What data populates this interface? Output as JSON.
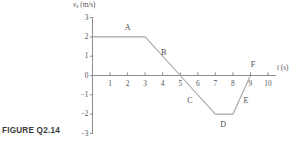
{
  "caption": "FIGURE Q2.14",
  "axes": {
    "y_title_main": "v",
    "y_title_sub": "x",
    "y_title_unit": " (m/s)",
    "x_title_main": "t",
    "x_title_unit": " (s)"
  },
  "chart_data": {
    "type": "line",
    "title": "",
    "xlabel": "t (s)",
    "ylabel": "v_x (m/s)",
    "xlim": [
      0,
      10.6
    ],
    "ylim": [
      -3,
      3
    ],
    "grid": false,
    "legend": "none",
    "xticks": [
      "1",
      "2",
      "3",
      "4",
      "5",
      "6",
      "7",
      "8",
      "9",
      "10"
    ],
    "xtick_values": [
      1,
      2,
      3,
      4,
      5,
      6,
      7,
      8,
      9,
      10
    ],
    "yticks": [
      "3",
      "2",
      "1",
      "0",
      "−1",
      "−2",
      "−3"
    ],
    "ytick_values": [
      3,
      2,
      1,
      0,
      -1,
      -2,
      -3
    ],
    "series": [
      {
        "name": "v_x",
        "x": [
          0,
          3,
          5,
          7,
          8,
          9
        ],
        "values": [
          2,
          2,
          0,
          -2,
          -2,
          0
        ]
      }
    ],
    "annotations": [
      {
        "label": "A",
        "x": 2.0,
        "y": 2.45
      },
      {
        "label": "B",
        "x": 4.05,
        "y": 1.18
      },
      {
        "label": "C",
        "x": 5.55,
        "y": -1.3
      },
      {
        "label": "D",
        "x": 7.45,
        "y": -2.58
      },
      {
        "label": "E",
        "x": 8.75,
        "y": -1.3
      },
      {
        "label": "F",
        "x": 9.15,
        "y": 0.52
      }
    ]
  }
}
